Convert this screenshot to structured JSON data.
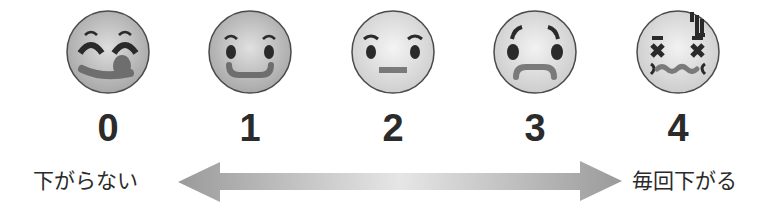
{
  "scale": {
    "items": [
      {
        "value": "0",
        "face": "tongue-out-happy-face"
      },
      {
        "value": "1",
        "face": "smiling-face"
      },
      {
        "value": "2",
        "face": "neutral-face"
      },
      {
        "value": "3",
        "face": "worried-face"
      },
      {
        "value": "4",
        "face": "distressed-dizzy-face"
      }
    ],
    "left_label": "下がらない",
    "right_label": "毎回下がる"
  },
  "colors": {
    "face_fill_0": "#b9b9b9",
    "face_fill_1": "#bdbdbd",
    "face_fill_light": "#e4e4e4",
    "outline": "#4a4a4a",
    "feature_dark": "#2a2a2a",
    "mouth_gray": "#7a7a7a",
    "arrow_dark": "#9a9a9a",
    "arrow_light": "#e6e6e6"
  }
}
